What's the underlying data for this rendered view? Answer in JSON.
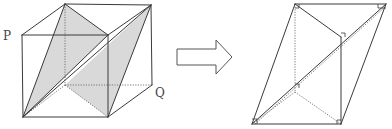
{
  "diagram": {
    "colors": {
      "edge": "#3a3a3a",
      "hidden_edge": "#6a6a6a",
      "shade": "#d9d9d9",
      "background": "#ffffff"
    },
    "left_figure": {
      "name": "cube",
      "labels": [
        {
          "id": "P",
          "text": "P",
          "x": 3,
          "y": 40
        },
        {
          "id": "Q",
          "text": "Q",
          "x": 155,
          "y": 97
        }
      ],
      "vertices": {
        "FTL": [
          22,
          35
        ],
        "FTR": [
          108,
          35
        ],
        "FBL": [
          23,
          117
        ],
        "FBR": [
          108,
          117
        ],
        "BTL": [
          65,
          4
        ],
        "BTR": [
          151,
          5
        ],
        "BBL": [
          65,
          85
        ],
        "BBR": [
          152,
          85
        ]
      },
      "shaded_faces": [
        {
          "id": "plane-1",
          "points": "65,4 23,117 108,35"
        },
        {
          "id": "plane-2",
          "points": "151,5 108,117 65,85"
        }
      ],
      "visible_edges": [
        "22,35 108,35",
        "108,35 108,117",
        "108,117 23,117",
        "23,117 22,35",
        "22,35 65,4",
        "65,4 151,5",
        "108,35 151,5",
        "151,5 152,85",
        "152,85 108,117",
        "65,4 23,117",
        "65,4 108,35",
        "23,117 108,35",
        "151,5 108,117",
        "23,117 151,5"
      ],
      "hidden_edges": [
        "65,4 65,85",
        "65,85 152,85",
        "65,85 23,117",
        "65,85 108,117"
      ]
    },
    "arrow": {
      "name": "transform-arrow",
      "direction": "right",
      "points": "177,49 216,49 216,40 232,57 216,74 216,65 177,65"
    },
    "right_figure": {
      "name": "parallelepiped",
      "vertices": {
        "A": [
          295,
          4
        ],
        "B": [
          386,
          4
        ],
        "C": [
          252,
          124
        ],
        "D": [
          341,
          124
        ],
        "E": [
          341,
          37
        ],
        "F": [
          295,
          92
        ],
        "G": [
          297,
          86
        ]
      },
      "visible_edges": [
        "295,4 386,4",
        "295,4 252,124",
        "386,4 341,124",
        "252,124 341,124",
        "295,4 341,37",
        "341,37 341,124",
        "252,124 386,4"
      ],
      "hidden_edges": [
        "295,4 295,92",
        "295,92 341,124",
        "252,124 295,92",
        "255,124 386,6"
      ],
      "right_angle_marks": [
        "341,33 345,33 345,37",
        "378,4 378,8 386,8",
        "295,8 299,8 299,4",
        "337,124 337,120 341,120",
        "252,119 257,119 257,124",
        "295,84 299,84 299,88"
      ]
    }
  }
}
